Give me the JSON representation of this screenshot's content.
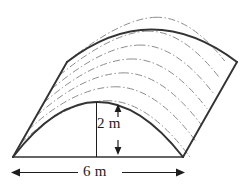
{
  "figure": {
    "name": "parabolic-prism-solid",
    "background_color": "#ffffff",
    "outline_color": "#333333",
    "ruling_color": "#8d8d8d",
    "dimension_color": "#1d1d1d"
  },
  "dimensions": {
    "height": {
      "label": "2 m",
      "value": 2,
      "unit": "m",
      "orientation": "vertical",
      "arrow_style": "double-headed"
    },
    "width": {
      "label": "6 m",
      "value": 6,
      "unit": "m",
      "orientation": "horizontal",
      "arrow_style": "double-headed"
    }
  },
  "geometry": {
    "front_arch": {
      "base_left_x": 13,
      "base_right_x": 183,
      "base_y": 157,
      "apex_x": 97,
      "apex_y": 102
    },
    "back_arch": {
      "base_left_x": 67,
      "base_right_x": 237,
      "base_y": 62,
      "apex_x": 151,
      "apex_y": 7
    },
    "ruling_count": 7
  }
}
